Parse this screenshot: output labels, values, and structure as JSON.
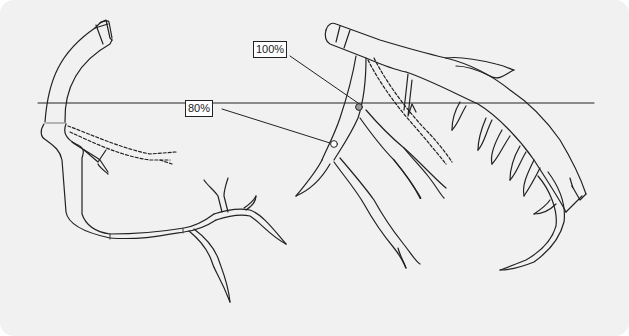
{
  "diagram": {
    "type": "coronary-angiogram-schematic",
    "annotations": [
      {
        "id": "stenosis-80",
        "label": "80%",
        "target": "left vessel segment (open circle marker)"
      },
      {
        "id": "stenosis-100",
        "label": "100%",
        "target": "proximal left coronary branch (filled gray marker)"
      }
    ],
    "elements": {
      "reference_line": "horizontal line across the figure",
      "collaterals": "dashed vessels indicating collateral flow"
    },
    "colors": {
      "background": "#f1f1f1",
      "stroke": "#222222",
      "vessel_fill": "#f1f1f1",
      "occlusion_marker": "#9a9a9a",
      "stenosis_marker": "#ffffff"
    }
  }
}
